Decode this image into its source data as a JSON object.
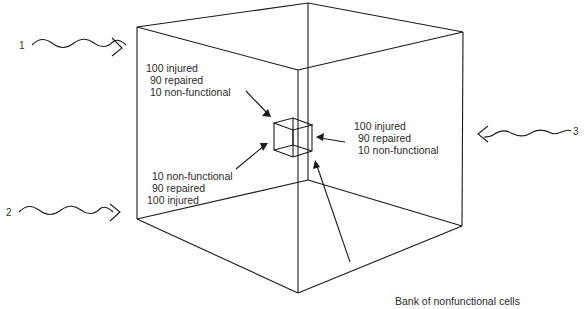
{
  "diagram": {
    "type": "3d-cube-cell-bank",
    "sources": [
      {
        "id": "1",
        "label": "1",
        "direction": "from-left-top"
      },
      {
        "id": "2",
        "label": "2",
        "direction": "from-left-bottom"
      },
      {
        "id": "3",
        "label": "3",
        "direction": "from-right"
      }
    ],
    "annotations": {
      "top_left": [
        "100 injured",
        "90 repaired",
        "10 non-functional"
      ],
      "bottom_left": [
        "10 non-functional",
        "90 repaired",
        "100 injured"
      ],
      "right": [
        "100 injured",
        "90 repaired",
        "10 non-functional"
      ]
    },
    "callout": "Bank of nonfunctional cells"
  },
  "colors": {
    "line": "#1a1a1a",
    "text": "#2a2a2a",
    "background": "#ffffff"
  }
}
